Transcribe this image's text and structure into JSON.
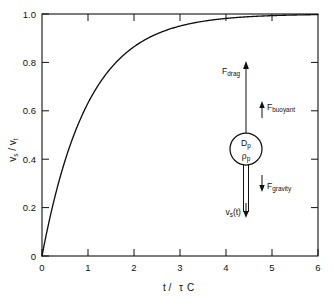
{
  "chart_data": {
    "type": "line",
    "title": "",
    "xlabel": "t / τC",
    "ylabel": "vₛ / vₜ",
    "xlim": [
      0,
      6
    ],
    "ylim": [
      0,
      1.0
    ],
    "grid": false,
    "legend": "none",
    "x_tick_labels": [
      "0",
      "1",
      "2",
      "3",
      "4",
      "5",
      "6"
    ],
    "x_ticks": [
      0,
      1,
      2,
      3,
      4,
      5,
      6
    ],
    "y_tick_labels": [
      "0",
      "0.2",
      "0.4",
      "0.6",
      "0.8",
      "1.0"
    ],
    "y_ticks": [
      0,
      0.2,
      0.4,
      0.6,
      0.8,
      1.0
    ],
    "series": [
      {
        "name": "v_s/v_t = 1 - exp(-t/τC)",
        "x": [
          0,
          0.1,
          0.2,
          0.3,
          0.4,
          0.5,
          0.6,
          0.7,
          0.8,
          0.9,
          1.0,
          1.2,
          1.4,
          1.6,
          1.8,
          2.0,
          2.25,
          2.5,
          2.75,
          3.0,
          3.25,
          3.5,
          3.75,
          4.0,
          4.5,
          5.0,
          5.5,
          6.0
        ],
        "values": [
          0,
          0.095,
          0.181,
          0.259,
          0.33,
          0.393,
          0.451,
          0.503,
          0.551,
          0.593,
          0.632,
          0.699,
          0.753,
          0.798,
          0.835,
          0.865,
          0.895,
          0.918,
          0.936,
          0.95,
          0.961,
          0.97,
          0.976,
          0.982,
          0.989,
          0.993,
          0.996,
          0.998
        ]
      }
    ]
  },
  "axes": {
    "x_title": "t /τC",
    "x_title_parts": {
      "var": "t /",
      "tau": "τ",
      "sub": "C"
    },
    "y_title_parts": {
      "v1": "v",
      "s1": "s",
      "slash": " / ",
      "v2": "v",
      "s2": "t"
    }
  },
  "diagram": {
    "name": "free-body-diagram",
    "particle": {
      "diameter_label": "D",
      "diameter_sub": "p",
      "density_label": "ρ",
      "density_sub": "p"
    },
    "forces": [
      {
        "id": "drag",
        "label": "F",
        "sub": "drag",
        "direction": "up"
      },
      {
        "id": "buoyant",
        "label": "F",
        "sub": "buoyant",
        "direction": "up"
      },
      {
        "id": "gravity",
        "label": "F",
        "sub": "gravity",
        "direction": "down"
      }
    ],
    "velocity": {
      "label": "v",
      "sub": "s",
      "arg": "(t)",
      "direction": "down"
    }
  },
  "colors": {
    "ink": "#111111",
    "background": "#ffffff"
  }
}
